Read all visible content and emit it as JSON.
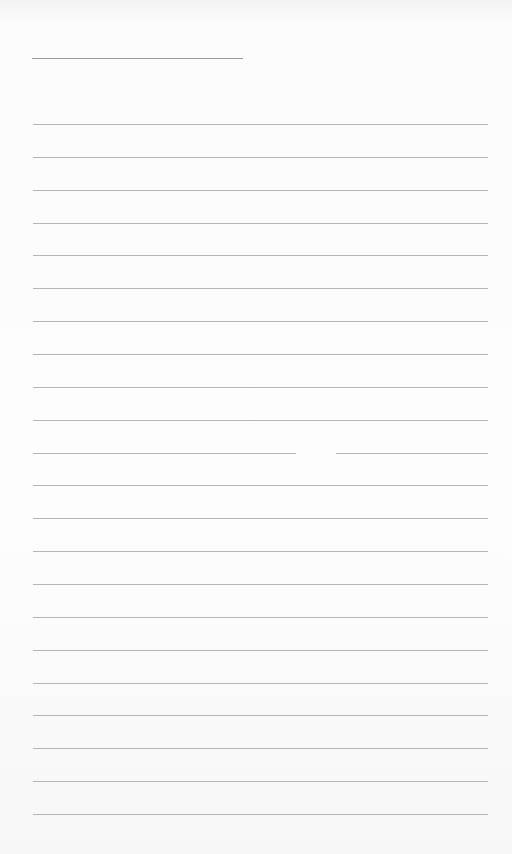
{
  "document": {
    "type": "lined-paper",
    "header_line": {
      "x": 32,
      "y": 58,
      "width": 211
    },
    "rules": {
      "count": 22,
      "first_y": 124,
      "spacing": 32.86,
      "x_start": 33,
      "x_end": 488,
      "color": "#b5b5b5"
    },
    "gap": {
      "rule_index": 10,
      "x_start": 296,
      "x_end": 336
    },
    "background": "#fbfbfb"
  }
}
